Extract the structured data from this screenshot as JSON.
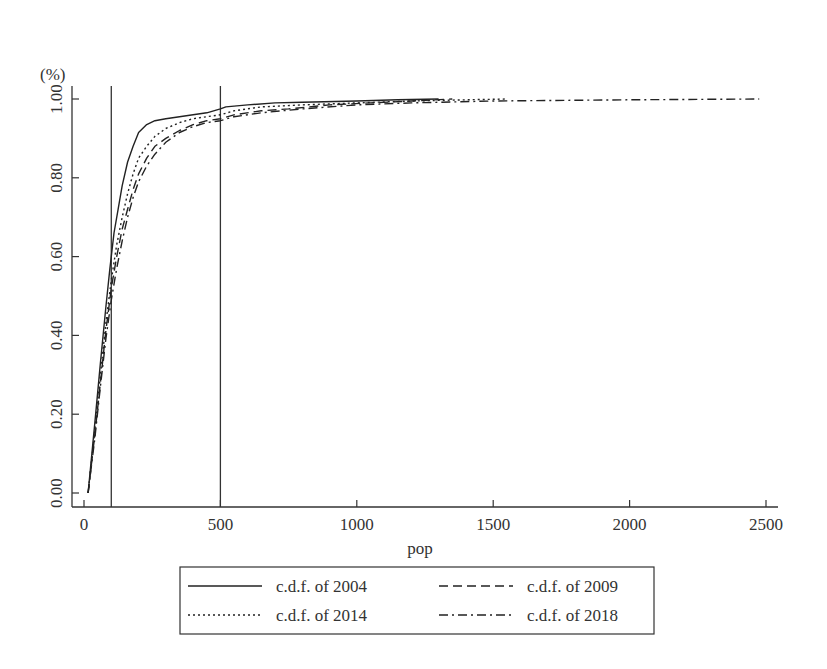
{
  "chart_data": {
    "type": "line",
    "title": "",
    "xlabel": "pop",
    "ylabel": "(%)",
    "xlim": [
      0,
      2500
    ],
    "ylim": [
      0,
      1.0
    ],
    "xticks": [
      0,
      500,
      1000,
      1500,
      2000,
      2500
    ],
    "xtick_labels": [
      "0",
      "500",
      "1000",
      "1500",
      "2000",
      "2500"
    ],
    "yticks": [
      0,
      0.2,
      0.4,
      0.6,
      0.8,
      1.0
    ],
    "ytick_labels": [
      "0.00",
      "0.20",
      "0.40",
      "0.60",
      "0.80",
      "1.00"
    ],
    "grid": false,
    "legend_position": "bottom",
    "reference_lines": [
      {
        "axis": "x",
        "value": 100
      },
      {
        "axis": "x",
        "value": 500
      }
    ],
    "series": [
      {
        "name": "c.d.f. of 2004",
        "style": "solid",
        "x": [
          15,
          40,
          60,
          80,
          95,
          110,
          125,
          140,
          160,
          180,
          200,
          230,
          260,
          300,
          350,
          400,
          450,
          500,
          520,
          600,
          700,
          800,
          1000,
          1150,
          1300
        ],
        "y": [
          0.0,
          0.18,
          0.33,
          0.47,
          0.57,
          0.66,
          0.72,
          0.78,
          0.84,
          0.88,
          0.915,
          0.935,
          0.945,
          0.95,
          0.955,
          0.96,
          0.965,
          0.975,
          0.98,
          0.985,
          0.99,
          0.992,
          0.995,
          0.998,
          1.0
        ]
      },
      {
        "name": "c.d.f. of 2009",
        "style": "dashed",
        "x": [
          15,
          40,
          60,
          80,
          100,
          120,
          140,
          160,
          180,
          200,
          230,
          260,
          300,
          350,
          400,
          450,
          500,
          550,
          650,
          750,
          900,
          1050,
          1200,
          1350
        ],
        "y": [
          0.0,
          0.15,
          0.28,
          0.41,
          0.52,
          0.6,
          0.67,
          0.72,
          0.77,
          0.81,
          0.85,
          0.88,
          0.9,
          0.92,
          0.935,
          0.945,
          0.95,
          0.96,
          0.97,
          0.975,
          0.985,
          0.99,
          0.995,
          1.0
        ]
      },
      {
        "name": "c.d.f. of 2014",
        "style": "dotted",
        "x": [
          15,
          40,
          60,
          80,
          100,
          120,
          140,
          160,
          180,
          200,
          230,
          260,
          300,
          350,
          400,
          450,
          500,
          550,
          650,
          800,
          1000,
          1200,
          1400,
          1550
        ],
        "y": [
          0.0,
          0.16,
          0.3,
          0.43,
          0.54,
          0.63,
          0.7,
          0.76,
          0.81,
          0.85,
          0.88,
          0.905,
          0.925,
          0.94,
          0.95,
          0.955,
          0.96,
          0.97,
          0.98,
          0.985,
          0.99,
          0.995,
          0.998,
          1.0
        ]
      },
      {
        "name": "c.d.f. of 2018",
        "style": "dashdot",
        "x": [
          15,
          40,
          60,
          80,
          100,
          120,
          140,
          160,
          180,
          200,
          230,
          260,
          300,
          350,
          400,
          450,
          500,
          550,
          650,
          800,
          1000,
          1200,
          1500,
          2000,
          2475
        ],
        "y": [
          0.0,
          0.14,
          0.27,
          0.39,
          0.49,
          0.57,
          0.64,
          0.7,
          0.75,
          0.79,
          0.83,
          0.86,
          0.89,
          0.915,
          0.93,
          0.94,
          0.945,
          0.955,
          0.965,
          0.975,
          0.985,
          0.99,
          0.995,
          0.998,
          1.0
        ]
      }
    ]
  },
  "legend": {
    "items": [
      {
        "label": "c.d.f. of 2004",
        "style": "solid"
      },
      {
        "label": "c.d.f. of 2009",
        "style": "dashed"
      },
      {
        "label": "c.d.f. of 2014",
        "style": "dotted"
      },
      {
        "label": "c.d.f. of 2018",
        "style": "dashdot"
      }
    ]
  },
  "colors": {
    "line": "#222222",
    "axis": "#333333",
    "background": "#ffffff"
  }
}
